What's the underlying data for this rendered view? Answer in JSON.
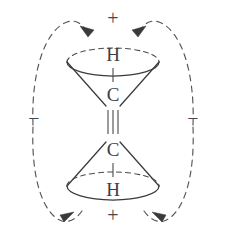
{
  "figure": {
    "background_color": "#ffffff",
    "line_color": "#3a3a3a",
    "dash_color": "#55555c"
  },
  "atoms": {
    "top_hydrogen": "H",
    "top_carbon": "C",
    "bottom_carbon": "C",
    "bottom_hydrogen": "H"
  },
  "bond": {
    "type": "triple",
    "glyph": "≡",
    "stroke_count": 3
  },
  "charges": {
    "top_sign": "+",
    "bottom_sign": "+",
    "left_sign": "−",
    "right_sign": "−"
  },
  "arrows": [
    {
      "name": "top-left-arrow",
      "direction": "into-top-lobe",
      "style": "dashed"
    },
    {
      "name": "top-right-arrow",
      "direction": "into-top-lobe",
      "style": "dashed"
    },
    {
      "name": "bottom-left-arrow",
      "direction": "outward-left",
      "style": "dashed"
    },
    {
      "name": "bottom-right-arrow",
      "direction": "outward-right",
      "style": "dashed"
    }
  ],
  "cones": {
    "top": {
      "name": "upper-cone",
      "apex": "bottom",
      "base": "top",
      "base_style": "ellipse"
    },
    "bottom": {
      "name": "lower-cone",
      "apex": "top",
      "base": "bottom",
      "base_style": "ellipse"
    }
  }
}
